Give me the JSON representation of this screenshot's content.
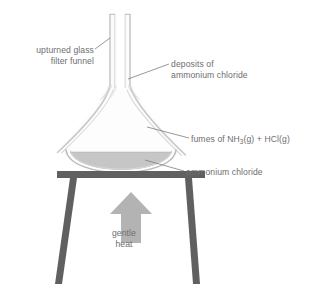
{
  "diagram": {
    "background_color": "#ffffff",
    "label_color": "#6e6e6e",
    "glass_color": "#c8c8c8",
    "glass_fill": "#f4f4f4",
    "powder_color": "#c2c2c2",
    "tripod_color": "#606060",
    "arrow_color": "#b3b3b3",
    "fume_color": "#dcdcdc",
    "leader_color": "#808080"
  },
  "labels": {
    "upturned_funnel": {
      "line1": "upturned glass",
      "line2": "filter funnel"
    },
    "deposits": {
      "line1": "deposits of",
      "line2": "ammonium chloride"
    },
    "fumes": {
      "prefix": "fumes of NH",
      "subscript": "3",
      "suffix": "(g) + HCl(g)"
    },
    "ammonium_chloride": "ammonium chloride",
    "gentle_heat": {
      "line1": "gentle",
      "line2": "heat"
    }
  },
  "parts": [
    {
      "name": "funnel-stem",
      "description": "vertical glass tube at top"
    },
    {
      "name": "funnel-cone",
      "description": "inverted conical glass funnel body"
    },
    {
      "name": "evaporating-dish",
      "description": "shallow dish holding solid"
    },
    {
      "name": "solid-powder",
      "description": "grey ammonium chloride powder in dish"
    },
    {
      "name": "fumes",
      "description": "three wavy vapour trails rising inside funnel"
    },
    {
      "name": "tripod",
      "description": "dark grey tripod stand with three legs"
    },
    {
      "name": "heat-arrow",
      "description": "upward block arrow indicating gentle heat"
    }
  ]
}
